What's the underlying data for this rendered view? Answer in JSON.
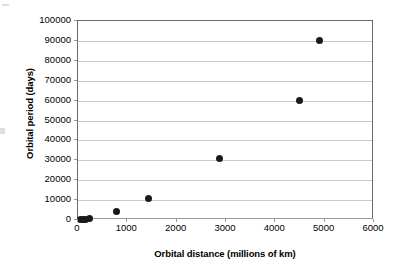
{
  "chart_data": {
    "type": "scatter",
    "title": "",
    "xlabel": "Orbital distance (millions of km)",
    "ylabel": "Orbital period (days)",
    "xlim": [
      0,
      6000
    ],
    "ylim": [
      0,
      100000
    ],
    "xticks": [
      0,
      1000,
      2000,
      3000,
      4000,
      5000,
      6000
    ],
    "yticks": [
      0,
      10000,
      20000,
      30000,
      40000,
      50000,
      60000,
      70000,
      80000,
      90000,
      100000
    ],
    "xtick_labels": [
      "0",
      "1000",
      "2000",
      "3000",
      "4000",
      "5000",
      "6000"
    ],
    "ytick_labels": [
      "0",
      "10000",
      "20000",
      "30000",
      "40000",
      "50000",
      "60000",
      "70000",
      "80000",
      "90000",
      "100000"
    ],
    "grid": "horizontal",
    "legend": "none",
    "marker": "filled-circle",
    "marker_color": "#1a1a1a",
    "series": [
      {
        "name": "Planets",
        "points": [
          {
            "x": 58,
            "y": 88
          },
          {
            "x": 108,
            "y": 225
          },
          {
            "x": 150,
            "y": 365
          },
          {
            "x": 228,
            "y": 687
          },
          {
            "x": 778,
            "y": 4333
          },
          {
            "x": 1427,
            "y": 10759
          },
          {
            "x": 2871,
            "y": 30685
          },
          {
            "x": 4498,
            "y": 60190
          },
          {
            "x": 4900,
            "y": 90000
          }
        ]
      }
    ]
  },
  "axes": {
    "x_title": "Orbital distance (millions of km)",
    "y_title": "Orbital period (days)"
  }
}
